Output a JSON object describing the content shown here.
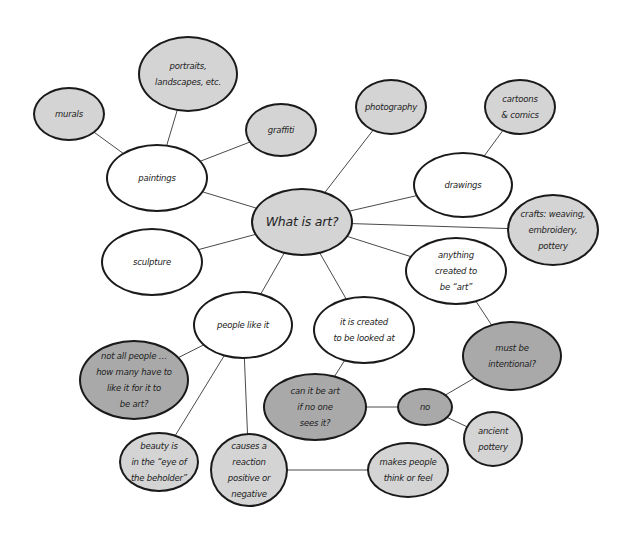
{
  "diagram": {
    "title": "What is art?",
    "type": "concept-map",
    "colors": {
      "white_fill": "#ffffff",
      "light_fill": "#d4d4d4",
      "medium_fill": "#a9a9a9",
      "outline": "#1a1a1a",
      "edge": "#4a4a4a"
    },
    "nodes": [
      {
        "id": "center",
        "label": "What is art?",
        "cx": 302,
        "cy": 222,
        "rx": 51,
        "ry": 34,
        "fill": "light"
      },
      {
        "id": "murals",
        "label": "murals",
        "cx": 69,
        "cy": 114,
        "rx": 36,
        "ry": 27,
        "fill": "light"
      },
      {
        "id": "portraits",
        "label": "portraits,\nlandscapes, etc.",
        "cx": 188,
        "cy": 74,
        "rx": 50,
        "ry": 38,
        "fill": "light"
      },
      {
        "id": "graffiti",
        "label": "graffiti",
        "cx": 281,
        "cy": 130,
        "rx": 36,
        "ry": 27,
        "fill": "light"
      },
      {
        "id": "paintings",
        "label": "paintings",
        "cx": 157,
        "cy": 178,
        "rx": 51,
        "ry": 34,
        "fill": "white"
      },
      {
        "id": "photography",
        "label": "photography",
        "cx": 391,
        "cy": 107,
        "rx": 36,
        "ry": 28,
        "fill": "light"
      },
      {
        "id": "cartoons",
        "label": "cartoons\n& comics",
        "cx": 520,
        "cy": 107,
        "rx": 36,
        "ry": 28,
        "fill": "light"
      },
      {
        "id": "drawings",
        "label": "drawings",
        "cx": 463,
        "cy": 185,
        "rx": 50,
        "ry": 33,
        "fill": "white"
      },
      {
        "id": "crafts",
        "label": "crafts: weaving,\nembroidery,\npottery",
        "cx": 553,
        "cy": 230,
        "rx": 46,
        "ry": 36,
        "fill": "light"
      },
      {
        "id": "sculpture",
        "label": "sculpture",
        "cx": 152,
        "cy": 262,
        "rx": 51,
        "ry": 34,
        "fill": "white"
      },
      {
        "id": "anything",
        "label": "anything\ncreated to\nbe “art”",
        "cx": 456,
        "cy": 271,
        "rx": 51,
        "ry": 34,
        "fill": "white"
      },
      {
        "id": "people_like",
        "label": "people like it",
        "cx": 243,
        "cy": 325,
        "rx": 50,
        "ry": 34,
        "fill": "white"
      },
      {
        "id": "looked_at",
        "label": "it is created\nto be looked at",
        "cx": 364,
        "cy": 330,
        "rx": 51,
        "ry": 34,
        "fill": "white"
      },
      {
        "id": "not_all",
        "label": "not all people …\nhow many have to\nlike it for it to\nbe art?",
        "cx": 134,
        "cy": 380,
        "rx": 55,
        "ry": 40,
        "fill": "medium"
      },
      {
        "id": "intentional",
        "label": "must be\nintentional?",
        "cx": 512,
        "cy": 356,
        "rx": 50,
        "ry": 35,
        "fill": "medium"
      },
      {
        "id": "no_one_sees",
        "label": "can it be art\nif no one\nsees it?",
        "cx": 315,
        "cy": 407,
        "rx": 52,
        "ry": 34,
        "fill": "medium"
      },
      {
        "id": "no",
        "label": "no",
        "cx": 425,
        "cy": 407,
        "rx": 28,
        "ry": 19,
        "fill": "medium"
      },
      {
        "id": "ancient",
        "label": "ancient\npottery",
        "cx": 493,
        "cy": 439,
        "rx": 30,
        "ry": 28,
        "fill": "light"
      },
      {
        "id": "beauty",
        "label": "beauty is\nin the “eye of\nthe beholder”",
        "cx": 159,
        "cy": 462,
        "rx": 40,
        "ry": 30,
        "fill": "light"
      },
      {
        "id": "reaction",
        "label": "causes a\nreaction\npositive or\nnegative",
        "cx": 249,
        "cy": 470,
        "rx": 39,
        "ry": 37,
        "fill": "light"
      },
      {
        "id": "think_feel",
        "label": "makes people\nthink or feel",
        "cx": 408,
        "cy": 470,
        "rx": 41,
        "ry": 28,
        "fill": "light"
      }
    ],
    "edges": [
      {
        "from": "center",
        "to": "paintings"
      },
      {
        "from": "center",
        "to": "photography"
      },
      {
        "from": "center",
        "to": "drawings"
      },
      {
        "from": "center",
        "to": "crafts"
      },
      {
        "from": "center",
        "to": "sculpture"
      },
      {
        "from": "center",
        "to": "anything"
      },
      {
        "from": "center",
        "to": "people_like"
      },
      {
        "from": "center",
        "to": "looked_at"
      },
      {
        "from": "paintings",
        "to": "murals"
      },
      {
        "from": "paintings",
        "to": "portraits"
      },
      {
        "from": "paintings",
        "to": "graffiti"
      },
      {
        "from": "drawings",
        "to": "cartoons"
      },
      {
        "from": "anything",
        "to": "intentional"
      },
      {
        "from": "people_like",
        "to": "not_all"
      },
      {
        "from": "people_like",
        "to": "beauty"
      },
      {
        "from": "people_like",
        "to": "reaction"
      },
      {
        "from": "looked_at",
        "to": "no_one_sees"
      },
      {
        "from": "no_one_sees",
        "to": "no"
      },
      {
        "from": "no",
        "to": "intentional"
      },
      {
        "from": "no",
        "to": "ancient"
      },
      {
        "from": "reaction",
        "to": "think_feel"
      }
    ]
  }
}
